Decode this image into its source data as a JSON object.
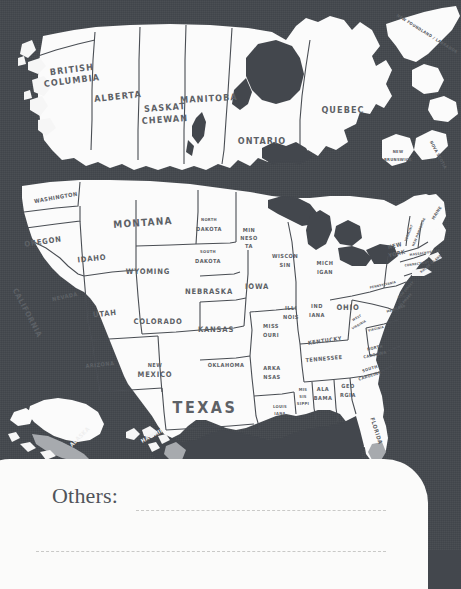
{
  "page": {
    "background_color": "#43474d",
    "land_color": "#fafafa",
    "label_color": "#5d6166"
  },
  "notes": {
    "others_label": "Others:",
    "line_1_value": "",
    "line_2_value": "",
    "line_placeholder": ""
  },
  "map": {
    "canada": {
      "provinces": [
        {
          "id": "british-columbia",
          "label": "BRITISH",
          "label2": "COLUMBIA",
          "x": 72,
          "y": 74
        },
        {
          "id": "alberta",
          "label": "ALBERTA",
          "x": 118,
          "y": 97
        },
        {
          "id": "saskatchewan",
          "label": "SASKAT",
          "label2": "CHEWAN",
          "x": 165,
          "y": 113
        },
        {
          "id": "manitoba",
          "label": "MANITOBA",
          "x": 209,
          "y": 99
        },
        {
          "id": "ontario",
          "label": "ONTARIO",
          "x": 262,
          "y": 141
        },
        {
          "id": "quebec",
          "label": "QUEBEC",
          "x": 343,
          "y": 110
        },
        {
          "id": "newfoundland-labrador",
          "label": "NEW FOUNDLAND / LABRADOR",
          "x": 427,
          "y": 34
        },
        {
          "id": "new-brunswick",
          "label": "NEW",
          "label2": "BRUNSWICK",
          "x": 398,
          "y": 158
        },
        {
          "id": "nova-scotia",
          "label": "NOVA SCOTIA",
          "x": 438,
          "y": 158
        }
      ]
    },
    "usa": {
      "states": [
        {
          "id": "washington",
          "label": "WASHINGTON",
          "x": 56,
          "y": 198
        },
        {
          "id": "oregon",
          "label": "OREGON",
          "x": 43,
          "y": 242
        },
        {
          "id": "california",
          "label": "CALIFORNIA",
          "x": 27,
          "y": 313
        },
        {
          "id": "nevada",
          "label": "NEVADA",
          "x": 65,
          "y": 297
        },
        {
          "id": "idaho",
          "label": "IDAHO",
          "x": 92,
          "y": 259
        },
        {
          "id": "montana",
          "label": "MONTANA",
          "x": 143,
          "y": 223
        },
        {
          "id": "wyoming",
          "label": "WYOMING",
          "x": 148,
          "y": 272
        },
        {
          "id": "utah",
          "label": "UTAH",
          "x": 105,
          "y": 314
        },
        {
          "id": "arizona",
          "label": "ARIZONA",
          "x": 100,
          "y": 365
        },
        {
          "id": "new-mexico",
          "label": "NEW",
          "label2": "MEXICO",
          "x": 155,
          "y": 370
        },
        {
          "id": "colorado",
          "label": "COLORADO",
          "x": 158,
          "y": 322
        },
        {
          "id": "north-dakota",
          "label": "NORTH",
          "label2": "DAKOTA",
          "x": 209,
          "y": 225
        },
        {
          "id": "south-dakota",
          "label": "SOUTH",
          "label2": "DAKOTA",
          "x": 208,
          "y": 257
        },
        {
          "id": "nebraska",
          "label": "NEBRASKA",
          "x": 209,
          "y": 292
        },
        {
          "id": "kansas",
          "label": "KANSAS",
          "x": 216,
          "y": 330
        },
        {
          "id": "oklahoma",
          "label": "OKLAHOMA",
          "x": 226,
          "y": 365
        },
        {
          "id": "texas",
          "label": "TEXAS",
          "x": 205,
          "y": 408
        },
        {
          "id": "minnesota",
          "label": "MIN",
          "label2": "NESO",
          "label3": "TA",
          "x": 249,
          "y": 238
        },
        {
          "id": "iowa",
          "label": "IOWA",
          "x": 257,
          "y": 287
        },
        {
          "id": "missouri",
          "label": "MISS",
          "label2": "OURI",
          "x": 271,
          "y": 330
        },
        {
          "id": "arkansas",
          "label": "ARKA",
          "label2": "NSAS",
          "x": 272,
          "y": 372
        },
        {
          "id": "louisiana",
          "label": "LOUIS",
          "label2": "IANA",
          "x": 280,
          "y": 411
        },
        {
          "id": "wisconsin",
          "label": "WISCON",
          "label2": "SIN",
          "x": 285,
          "y": 260
        },
        {
          "id": "illinois",
          "label": "ILLI",
          "label2": "NOIS",
          "x": 291,
          "y": 312
        },
        {
          "id": "michigan",
          "label": "MICH",
          "label2": "IGAN",
          "x": 325,
          "y": 267
        },
        {
          "id": "indiana",
          "label": "IND",
          "label2": "IANA",
          "x": 317,
          "y": 310
        },
        {
          "id": "ohio",
          "label": "OHIO",
          "x": 348,
          "y": 308
        },
        {
          "id": "kentucky",
          "label": "KENTUCKY",
          "x": 325,
          "y": 341
        },
        {
          "id": "tennessee",
          "label": "TENNESSEE",
          "x": 324,
          "y": 359
        },
        {
          "id": "mississippi",
          "label": "MIS",
          "label2": "SIS",
          "label3": "SIPPI",
          "x": 303,
          "y": 397
        },
        {
          "id": "alabama",
          "label": "ALA",
          "label2": "BAMA",
          "x": 323,
          "y": 393
        },
        {
          "id": "georgia",
          "label": "GEO",
          "label2": "RGIA",
          "x": 348,
          "y": 390
        },
        {
          "id": "florida",
          "label": "FLORIDA",
          "x": 376,
          "y": 431
        },
        {
          "id": "south-carolina",
          "label": "SOUTH",
          "label2": "CAROLINA",
          "x": 370,
          "y": 372
        },
        {
          "id": "north-carolina",
          "label": "NORTH",
          "label2": "CAROLINA",
          "x": 375,
          "y": 351
        },
        {
          "id": "virginia",
          "label": "VIRGINIA",
          "x": 376,
          "y": 329
        },
        {
          "id": "west-virginia",
          "label": "WEST",
          "label2": "VIRGINIA",
          "x": 357,
          "y": 322
        },
        {
          "id": "pennsylvania",
          "label": "PENNSYLVANIA",
          "x": 383,
          "y": 285
        },
        {
          "id": "new-york",
          "label": "NEW",
          "label2": "YORK",
          "x": 397,
          "y": 250
        },
        {
          "id": "maine",
          "label": "MAINE",
          "x": 437,
          "y": 216
        },
        {
          "id": "vermont",
          "label": "VERMONT",
          "x": 409,
          "y": 235
        },
        {
          "id": "new-hampshire",
          "label": "NEW HAMPSHIRE",
          "x": 418,
          "y": 234
        },
        {
          "id": "massachusetts",
          "label": "MASSACHUSETTS",
          "x": 424,
          "y": 255
        },
        {
          "id": "connecticut",
          "label": "CONNECTICUT",
          "x": 418,
          "y": 266
        },
        {
          "id": "rhode-island",
          "label": "RHODE ISLAND",
          "x": 429,
          "y": 266
        },
        {
          "id": "new-jersey",
          "label": "NEW JERSEY",
          "x": 405,
          "y": 291
        },
        {
          "id": "delaware",
          "label": "DELAWARE",
          "x": 404,
          "y": 301
        },
        {
          "id": "maryland",
          "label": "MARYLAND",
          "x": 397,
          "y": 309
        },
        {
          "id": "alaska",
          "label": "ALASKA",
          "x": 80,
          "y": 437
        },
        {
          "id": "hawaii",
          "label": "HAWAII",
          "x": 152,
          "y": 436
        }
      ]
    }
  }
}
